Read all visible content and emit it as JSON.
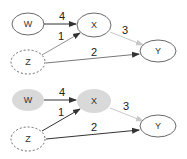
{
  "colors": {
    "node_fill_observed": "#d9d9d9",
    "edge_dark": "#333333",
    "edge_light": "#c8c8c8",
    "stroke": "#444444"
  },
  "diagrams": [
    {
      "nodes": {
        "W": "W",
        "X": "X",
        "Y": "Y",
        "Z": "Z"
      },
      "edges": {
        "w_x": "4",
        "z_x": "1",
        "z_y": "2",
        "x_y": "3"
      }
    },
    {
      "nodes": {
        "W": "W",
        "X": "X",
        "Y": "Y",
        "Z": "Z"
      },
      "edges": {
        "w_x": "4",
        "z_x": "1",
        "z_y": "2",
        "x_y": "3"
      }
    }
  ]
}
